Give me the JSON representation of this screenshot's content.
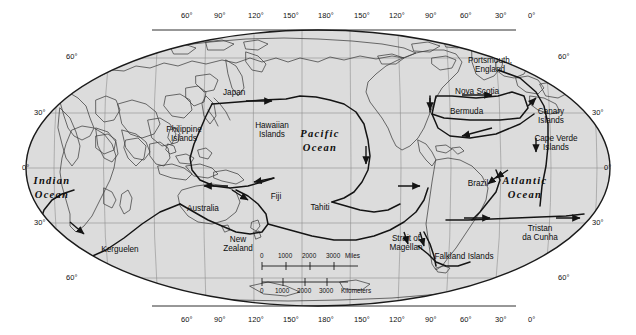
{
  "map": {
    "title": "World map with voyage routes",
    "projection": "Robinson-style oval world projection",
    "colors": {
      "land_and_sea_fill": "#dcdcdc",
      "outside_fill": "#ffffff",
      "coastline": "#3c3c3c",
      "graticule": "#8a8a8a",
      "border": "#1a1a1a",
      "route": "#141414",
      "text": "#0d0d0d"
    },
    "graticule": {
      "top_longitude_labels": [
        "60°",
        "90°",
        "120°",
        "150°",
        "180°",
        "150°",
        "120°",
        "90°",
        "60°",
        "30°",
        "0°"
      ],
      "bottom_longitude_labels": [
        "60°",
        "90°",
        "120°",
        "150°",
        "180°",
        "150°",
        "120°",
        "90°",
        "60°",
        "30°",
        "0°"
      ],
      "left_latitude_labels": [
        "60°",
        "30°",
        "0°",
        "30°",
        "60°"
      ],
      "right_latitude_labels": [
        "60°",
        "30°",
        "0°",
        "30°",
        "60°"
      ]
    },
    "oceans": [
      {
        "name": "Indian\nOcean",
        "x": 52,
        "y": 182
      },
      {
        "name": "Pacific\nOcean",
        "x": 320,
        "y": 135
      },
      {
        "name": "Atlantic\nOcean",
        "x": 525,
        "y": 182
      }
    ],
    "places": [
      {
        "label": "Japan",
        "x": 223,
        "y": 92,
        "align": "left"
      },
      {
        "label": "Philippine\nIslands",
        "x": 184,
        "y": 132,
        "align": "center"
      },
      {
        "label": "Hawaiian\nIslands",
        "x": 272,
        "y": 128,
        "align": "center"
      },
      {
        "label": "Australia",
        "x": 203,
        "y": 209,
        "align": "center"
      },
      {
        "label": "Fiji",
        "x": 276,
        "y": 197,
        "align": "center"
      },
      {
        "label": "Tahiti",
        "x": 320,
        "y": 208,
        "align": "center"
      },
      {
        "label": "New\nZealand",
        "x": 238,
        "y": 241,
        "align": "center"
      },
      {
        "label": "Kerguelen",
        "x": 120,
        "y": 250,
        "align": "center"
      },
      {
        "label": "Portsmouth,\nEngland",
        "x": 490,
        "y": 63,
        "align": "center"
      },
      {
        "label": "Nova Scotia",
        "x": 459,
        "y": 92,
        "align": "left"
      },
      {
        "label": "Bermuda",
        "x": 452,
        "y": 112,
        "align": "left"
      },
      {
        "label": "Canary\nIslands",
        "x": 551,
        "y": 114,
        "align": "center"
      },
      {
        "label": "Cape Verde\nIslands",
        "x": 556,
        "y": 141,
        "align": "center"
      },
      {
        "label": "Brazil",
        "x": 478,
        "y": 183,
        "align": "center"
      },
      {
        "label": "Tristan\nda Cunha",
        "x": 540,
        "y": 231,
        "align": "center"
      },
      {
        "label": "Strait of\nMagellan",
        "x": 406,
        "y": 240,
        "align": "center"
      },
      {
        "label": "Falkland Islands",
        "x": 464,
        "y": 256,
        "align": "center"
      }
    ],
    "scale_bar": {
      "miles": {
        "ticks": [
          "0",
          "1000",
          "2000",
          "3000"
        ],
        "unit": "Miles"
      },
      "kilometers": {
        "ticks": [
          "0",
          "1000",
          "2000",
          "3000"
        ],
        "unit": "Kilometers"
      }
    }
  }
}
